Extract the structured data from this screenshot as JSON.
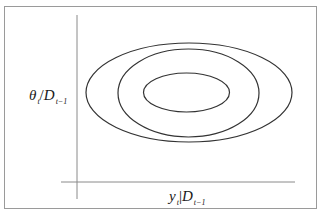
{
  "figure": {
    "top_cut_text": "",
    "y_axis_label": {
      "main": "θ",
      "main_sub": "t",
      "sep": "/",
      "given": "D",
      "given_sub": "t−1"
    },
    "x_axis_label": {
      "main": "y",
      "main_sub": "t",
      "sep": "|",
      "given": "D",
      "given_sub": "t−1"
    },
    "ellipses": [
      {
        "name": "outer-contour",
        "cx": 189,
        "cy": 92.5,
        "rx": 103,
        "ry": 49.5
      },
      {
        "name": "middle-contour",
        "cx": 188.5,
        "cy": 93,
        "rx": 70.5,
        "ry": 44
      },
      {
        "name": "inner-contour",
        "cx": 186.5,
        "cy": 92.5,
        "rx": 43,
        "ry": 19.5
      }
    ],
    "stroke_color": "#333333",
    "axis_color": "#8a8a8a",
    "frame_color": "#9a9a9a"
  }
}
